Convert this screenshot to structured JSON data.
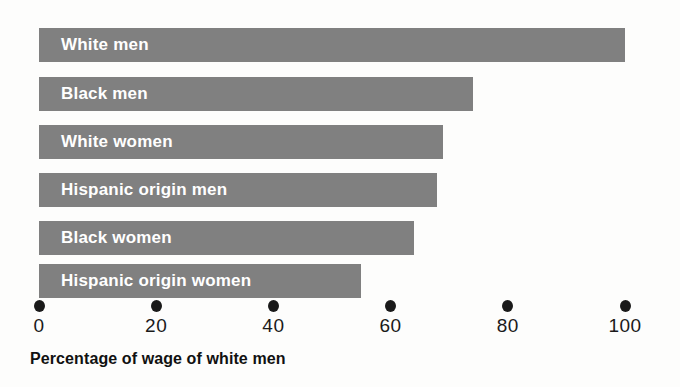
{
  "chart_data": {
    "type": "bar",
    "orientation": "horizontal",
    "title": "",
    "xlabel": "Percentage of wage of white men",
    "ylabel": "",
    "categories": [
      "White men",
      "Black men",
      "White women",
      "Hispanic origin men",
      "Black women",
      "Hispanic origin women"
    ],
    "values": [
      100,
      74,
      69,
      68,
      64,
      55
    ],
    "xlim": [
      0,
      100
    ],
    "xticks": [
      0,
      20,
      40,
      60,
      80,
      100
    ],
    "xtick_labels": [
      "0",
      "20",
      "40",
      "60",
      "80",
      "100"
    ],
    "grid": false,
    "legend": false,
    "bar_color": "#808080",
    "label_color": "#ffffff",
    "axis_color": "#1a1a1a",
    "background": "#fdfdfc"
  }
}
